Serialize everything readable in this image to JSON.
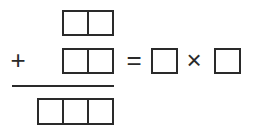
{
  "puzzle": {
    "operators": {
      "plus": "+",
      "equals": "=",
      "times": "×"
    },
    "addend_top": {
      "digits": [
        "",
        ""
      ]
    },
    "addend_bottom": {
      "digits": [
        "",
        ""
      ]
    },
    "sum": {
      "digits": [
        "",
        "",
        ""
      ]
    },
    "factor_left": {
      "digits": [
        ""
      ]
    },
    "factor_right": {
      "digits": [
        ""
      ]
    }
  }
}
